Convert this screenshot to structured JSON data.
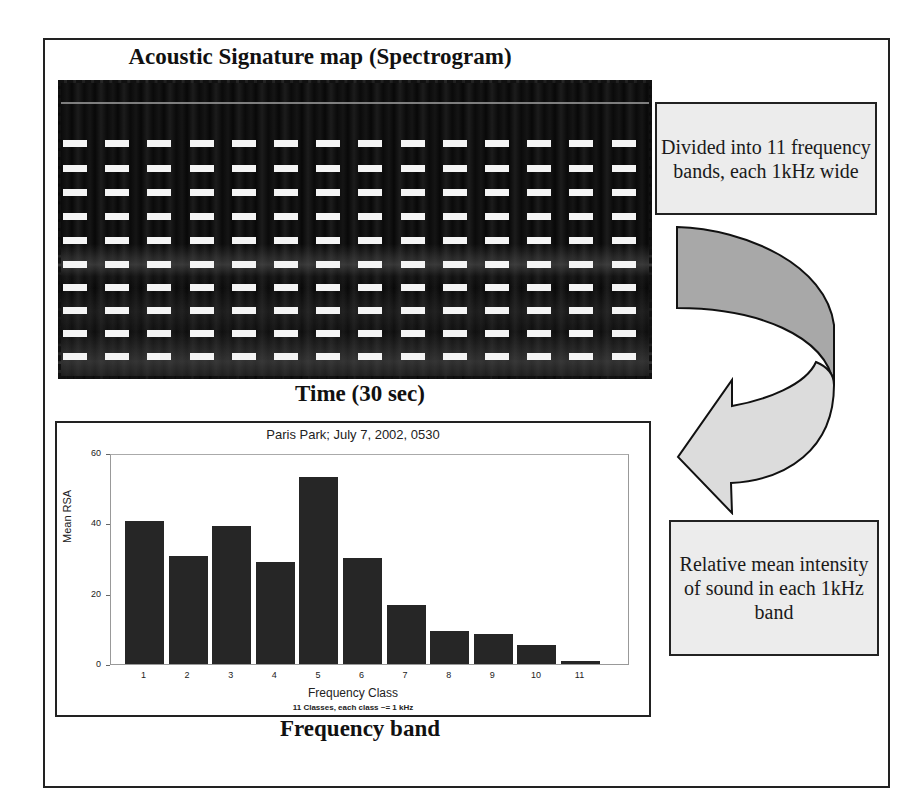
{
  "diagram": {
    "title": "Acoustic Signature map (Spectrogram)",
    "spectrogram": {
      "x_axis_label": "Time (30 sec)",
      "band_divider_rows": 10,
      "dash_columns": 14
    },
    "callouts": {
      "top": "Divided into 11 frequency bands, each 1kHz wide",
      "bottom": "Relative mean intensity of sound in each 1kHz band"
    },
    "arrow": {
      "name": "curved-arrow",
      "fill_top": "#a8a8a8",
      "fill_bottom": "#dcdcdc"
    },
    "bottom_label": "Frequency band",
    "colors": {
      "frame": "#222222",
      "callout_fill": "#ececec",
      "bar_fill": "#262626"
    }
  },
  "chart_data": {
    "type": "bar",
    "title": "Paris Park; July 7, 2002, 0530",
    "xlabel": "Frequency Class",
    "xlabel_sub": "11 Classes, each class ~= 1 kHz",
    "ylabel": "Mean RSA",
    "categories": [
      "1",
      "2",
      "3",
      "4",
      "5",
      "6",
      "7",
      "8",
      "9",
      "10",
      "11"
    ],
    "values": [
      40.5,
      30.7,
      39.2,
      29.0,
      53.1,
      30.1,
      16.8,
      9.4,
      8.6,
      5.4,
      0.8
    ],
    "yticks": [
      "0",
      "20",
      "40",
      "60"
    ],
    "ylim": [
      0,
      62
    ],
    "grid": false,
    "legend": null
  }
}
